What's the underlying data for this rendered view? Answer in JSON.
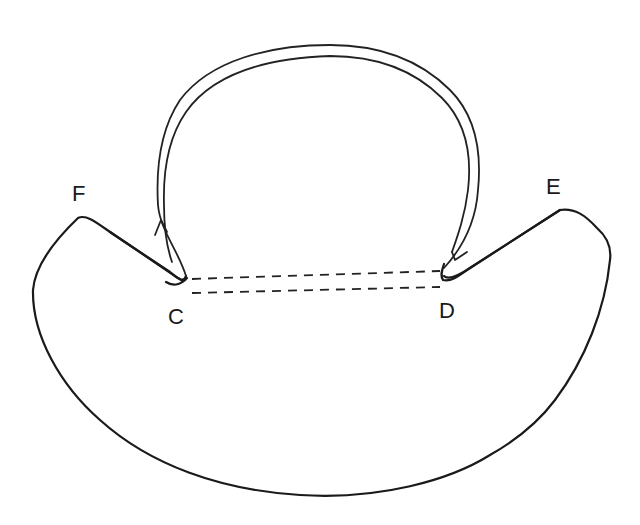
{
  "diagram": {
    "type": "hand-drawn line sketch",
    "labels": {
      "F": "F",
      "E": "E",
      "C": "C",
      "D": "D"
    },
    "elements": [
      {
        "name": "bowl-shape",
        "description": "Crescent-shaped body with two peaks (F, E) and two inner notches (C, D)"
      },
      {
        "name": "dashed-connection",
        "description": "Two parallel dashed lines joining notch C to notch D"
      },
      {
        "name": "arch-arrow",
        "description": "Double-lined arch rising from D over the top and returning down to C, with arrowheads near D (down) and C (up)"
      }
    ],
    "colors": {
      "stroke": "#1a1a1a",
      "background": "#ffffff"
    }
  }
}
